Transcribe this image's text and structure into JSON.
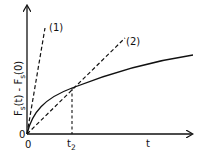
{
  "diagram": {
    "y_axis_label": "F",
    "y_axis_label_sub1": "s",
    "y_axis_label_mid": "(t) - F",
    "y_axis_label_sub2": "s",
    "y_axis_label_end": "(0)",
    "x_axis_label": "t",
    "origin_x_label": "0",
    "origin_y_label": "0",
    "tick_label": "t",
    "tick_label_sub": "2",
    "line1_label": "(1)",
    "line2_label": "(2)",
    "colors": {
      "ink": "#111111",
      "background": "#ffffff"
    }
  }
}
